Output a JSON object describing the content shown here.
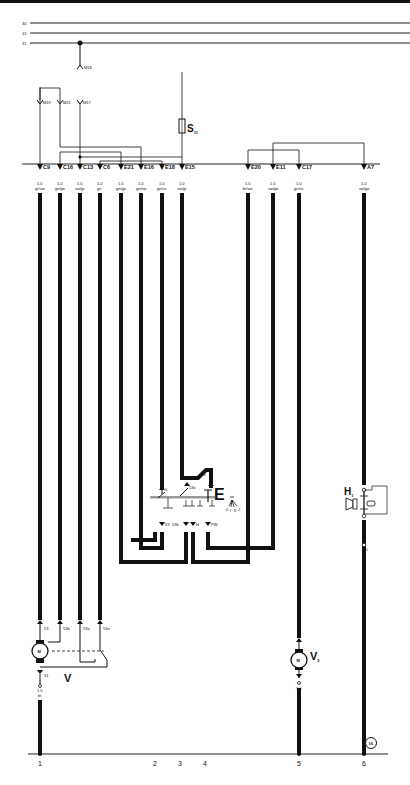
{
  "diagram": {
    "bus_lines": [
      {
        "label": "30",
        "y": 23
      },
      {
        "label": "15",
        "y": 33
      },
      {
        "label": "31",
        "y": 43
      }
    ],
    "ground_label": "M18",
    "upper_ground_labels": [
      "M19",
      "M21",
      "M17"
    ],
    "fuse": {
      "label": "S",
      "sub": "11"
    },
    "connectors": [
      {
        "id": "C9",
        "x": 40,
        "size": "1.0",
        "color": "gr/sw"
      },
      {
        "id": "C16",
        "x": 60,
        "size": "1.0",
        "color": "gn/ge"
      },
      {
        "id": "C13",
        "x": 80,
        "size": "1.0",
        "color": "sw/gr"
      },
      {
        "id": "C6",
        "x": 100,
        "size": "1.0",
        "color": "gn"
      },
      {
        "id": "E21",
        "x": 121,
        "size": "1.0",
        "color": "gn/ge"
      },
      {
        "id": "E16",
        "x": 141,
        "size": "1.0",
        "color": "gn/sw"
      },
      {
        "id": "E18",
        "x": 162,
        "size": "1.0",
        "color": "gn/ro"
      },
      {
        "id": "E15",
        "x": 182,
        "size": "1.0",
        "color": "sw/gr"
      },
      {
        "id": "E20",
        "x": 248,
        "size": "1.0",
        "color": "br/ws"
      },
      {
        "id": "E11",
        "x": 273,
        "size": "1.0",
        "color": "sw/ge"
      },
      {
        "id": "C17",
        "x": 299,
        "size": "1.0",
        "color": "gn/ro"
      },
      {
        "id": "A7",
        "x": 364,
        "size": "1.0",
        "color": "sw/ge"
      }
    ],
    "switch": {
      "label": "E",
      "terminals": [
        "5",
        "53e",
        "53",
        "53b",
        "H",
        "PW"
      ],
      "top_size": "1.0",
      "positions": [
        "0",
        "I",
        "II",
        "2"
      ]
    },
    "wiper_motor": {
      "label": "V",
      "motor_symbol": "M",
      "terminals": [
        "53",
        "53b",
        "53a",
        "53e"
      ],
      "ground_terminal": "31",
      "ground_wire": {
        "size": "1.5",
        "color": "br"
      }
    },
    "washer_motor": {
      "label": "V",
      "sub": "5",
      "motor_symbol": "M",
      "ground_wire": {
        "size": "1.0",
        "color": "br"
      }
    },
    "horn": {
      "label": "H",
      "sub": "1",
      "wire": {
        "size": "1.0",
        "color": "br"
      }
    },
    "ground_point": "16",
    "current_track_numbers": [
      {
        "n": "1",
        "x": 40
      },
      {
        "n": "2",
        "x": 155
      },
      {
        "n": "3",
        "x": 180
      },
      {
        "n": "4",
        "x": 205
      },
      {
        "n": "5",
        "x": 299
      },
      {
        "n": "6",
        "x": 364
      }
    ],
    "colors": {
      "ink": "#111111",
      "paper": "#ffffff",
      "rule": "#222222"
    }
  }
}
